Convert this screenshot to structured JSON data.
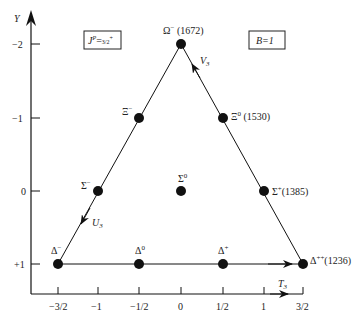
{
  "boxes": {
    "spin_parity": "J^P = 3/2^+",
    "spin_parity_main": "J",
    "spin_parity_sup": "P",
    "spin_parity_eq": "=",
    "spin_parity_val": "3/2",
    "spin_parity_valsup": "+",
    "baryon_number": "B=1"
  },
  "axes": {
    "y_label": "Y",
    "x_label": "T",
    "x_label_sub": "3",
    "y_ticks": [
      "−2",
      "−1",
      "0",
      "+1"
    ],
    "x_ticks": [
      "−3/2",
      "−1",
      "−1/2",
      "0",
      "1/2",
      "1",
      "3/2"
    ]
  },
  "shift_operators": {
    "V": "V",
    "V_sub": "3",
    "U": "U",
    "U_sub": "3",
    "T": "T",
    "T_sub": "3"
  },
  "particles": [
    {
      "name": "Ω",
      "charge": "−",
      "mass": "(1672)",
      "T3": 0,
      "Y": -2
    },
    {
      "name": "Ξ",
      "charge": "−",
      "mass": "",
      "T3": -0.5,
      "Y": -1
    },
    {
      "name": "Ξ",
      "charge": "0",
      "mass": "(1530)",
      "T3": 0.5,
      "Y": -1
    },
    {
      "name": "Σ",
      "charge": "−",
      "mass": "",
      "T3": -1,
      "Y": 0
    },
    {
      "name": "Σ",
      "charge": "0",
      "mass": "",
      "T3": 0,
      "Y": 0
    },
    {
      "name": "Σ",
      "charge": "+",
      "mass": "(1385)",
      "T3": 1,
      "Y": 0
    },
    {
      "name": "Δ",
      "charge": "−",
      "mass": "",
      "T3": -1.5,
      "Y": 1
    },
    {
      "name": "Δ",
      "charge": "0",
      "mass": "",
      "T3": -0.5,
      "Y": 1
    },
    {
      "name": "Δ",
      "charge": "+",
      "mass": "",
      "T3": 0.5,
      "Y": 1
    },
    {
      "name": "Δ",
      "charge": "++",
      "mass": "(1236)",
      "T3": 1.5,
      "Y": 1
    }
  ],
  "colors": {
    "ink": "#111111",
    "background": "#ffffff"
  }
}
